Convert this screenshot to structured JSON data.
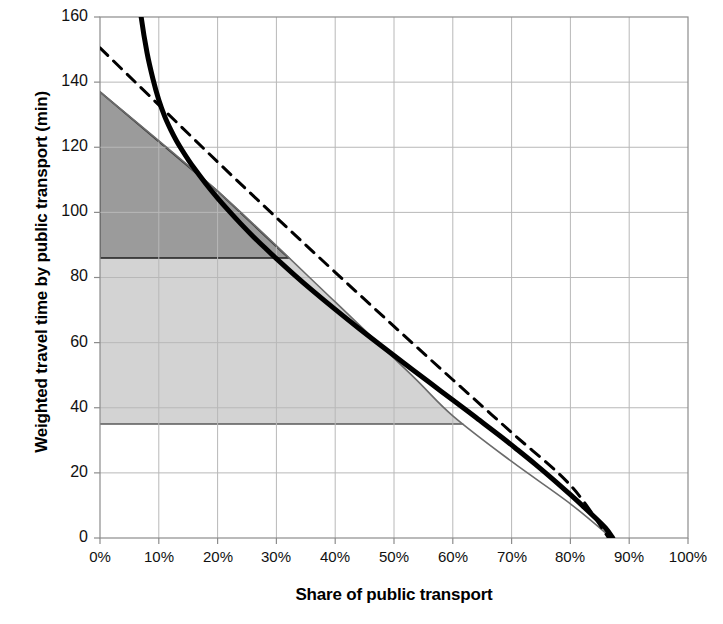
{
  "chart_data": {
    "type": "line",
    "title": "",
    "xlabel": "Share of public transport",
    "ylabel": "Weighted travel time by public transport (min)",
    "xlim": [
      0,
      100
    ],
    "ylim": [
      0,
      160
    ],
    "xtick_labels": [
      "0%",
      "10%",
      "20%",
      "30%",
      "40%",
      "50%",
      "60%",
      "70%",
      "80%",
      "90%",
      "100%"
    ],
    "xtick_values": [
      0,
      10,
      20,
      30,
      40,
      50,
      60,
      70,
      80,
      90,
      100
    ],
    "ytick_labels": [
      "0",
      "20",
      "40",
      "60",
      "80",
      "100",
      "120",
      "140",
      "160"
    ],
    "ytick_values": [
      0,
      20,
      40,
      60,
      80,
      100,
      120,
      140,
      160
    ],
    "grid": true,
    "legend": "none",
    "series": [
      {
        "name": "thick-solid-curve",
        "style": "solid",
        "color": "#000000",
        "width": 5,
        "points": [
          [
            6.0,
            175.0
          ],
          [
            7.0,
            160.0
          ],
          [
            8.0,
            149.0
          ],
          [
            9.0,
            141.0
          ],
          [
            10.0,
            134.5
          ],
          [
            11.0,
            129.5
          ],
          [
            12.0,
            125.5
          ],
          [
            13.0,
            122.0
          ],
          [
            14.0,
            119.0
          ],
          [
            15.0,
            116.2
          ],
          [
            16.0,
            113.6
          ],
          [
            18.0,
            108.8
          ],
          [
            20.0,
            104.4
          ],
          [
            22.0,
            100.3
          ],
          [
            24.0,
            96.4
          ],
          [
            26.0,
            92.7
          ],
          [
            28.0,
            89.2
          ],
          [
            30.0,
            85.8
          ],
          [
            33.0,
            80.9
          ],
          [
            36.0,
            76.2
          ],
          [
            40.0,
            70.2
          ],
          [
            44.0,
            64.4
          ],
          [
            48.0,
            58.8
          ],
          [
            52.0,
            53.3
          ],
          [
            56.0,
            47.8
          ],
          [
            60.0,
            42.4
          ],
          [
            64.0,
            36.9
          ],
          [
            68.0,
            31.4
          ],
          [
            71.0,
            27.1
          ],
          [
            74.0,
            22.7
          ],
          [
            77.0,
            18.1
          ],
          [
            80.0,
            13.3
          ],
          [
            82.0,
            10.0
          ],
          [
            84.0,
            6.6
          ],
          [
            86.0,
            3.0
          ],
          [
            87.2,
            0.0
          ]
        ]
      },
      {
        "name": "dashed-line",
        "style": "dashed",
        "color": "#000000",
        "width": 3,
        "points": [
          [
            0.0,
            150.5
          ],
          [
            10.0,
            133.0
          ],
          [
            20.0,
            115.5
          ],
          [
            30.0,
            98.4
          ],
          [
            40.0,
            81.6
          ],
          [
            50.0,
            65.0
          ],
          [
            60.0,
            48.6
          ],
          [
            70.0,
            32.4
          ],
          [
            80.0,
            16.2
          ],
          [
            86.5,
            0.0
          ]
        ]
      },
      {
        "name": "thin-boundary-line",
        "style": "solid",
        "color": "#6b6b6b",
        "width": 1.6,
        "points": [
          [
            0.0,
            137.0
          ],
          [
            20.0,
            106.5
          ],
          [
            40.0,
            72.5
          ],
          [
            53.0,
            50.0
          ],
          [
            60.0,
            37.5
          ],
          [
            70.0,
            23.5
          ],
          [
            80.0,
            10.5
          ],
          [
            87.0,
            0.0
          ]
        ]
      }
    ],
    "shaded_regions": [
      {
        "name": "dark-gray-region",
        "fill": "#9a9a9a",
        "y_top": 137,
        "y_bottom": 86,
        "x_start": 0,
        "description": "darker shaded area between the thin boundary line and the 86 min horizontal line"
      },
      {
        "name": "light-gray-region",
        "fill": "#d2d2d2",
        "y_top": 86,
        "y_bottom": 35,
        "x_start": 0,
        "description": "lighter shaded area between 86 min and 35 min bounded on the right by the thin line"
      }
    ]
  }
}
